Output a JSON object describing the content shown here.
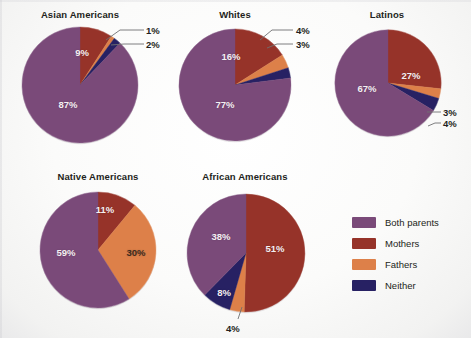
{
  "colors": {
    "both_parents": "#7a4a79",
    "mothers": "#963329",
    "fathers": "#dd8049",
    "neither": "#272163",
    "background": "#fbfbfa",
    "text": "#231f20",
    "label_light": "#f4eff2",
    "label_dark": "#3d2b1f",
    "leader_line": "#6f6f72"
  },
  "legend": {
    "position": "right",
    "items": [
      {
        "label": "Both parents",
        "color": "#7a4a79"
      },
      {
        "label": "Mothers",
        "color": "#963329"
      },
      {
        "label": "Fathers",
        "color": "#dd8049"
      },
      {
        "label": "Neither",
        "color": "#272163"
      }
    ]
  },
  "chart_data": {
    "type": "pie",
    "title": "",
    "subtitle": "",
    "xlabel": "",
    "ylabel": "",
    "grid": false,
    "legend_position": "right",
    "legend_entries": [
      "Both parents",
      "Mothers",
      "Fathers",
      "Neither"
    ],
    "units": "percent",
    "categories": [
      "Both parents",
      "Mothers",
      "Fathers",
      "Neither"
    ],
    "charts": [
      {
        "title": "Asian Americans",
        "values": [
          87,
          9,
          1,
          2
        ],
        "labels": [
          "87%",
          "9%",
          "1%",
          "2%"
        ],
        "label_placement": [
          "inside",
          "inside",
          "outside",
          "outside"
        ]
      },
      {
        "title": "Whites",
        "values": [
          77,
          16,
          4,
          3
        ],
        "labels": [
          "77%",
          "16%",
          "4%",
          "3%"
        ],
        "label_placement": [
          "inside",
          "inside",
          "outside",
          "outside"
        ]
      },
      {
        "title": "Latinos",
        "values": [
          67,
          27,
          3,
          4
        ],
        "labels": [
          "67%",
          "27%",
          "3%",
          "4%"
        ],
        "label_placement": [
          "inside",
          "inside",
          "outside",
          "outside"
        ]
      },
      {
        "title": "Native Americans",
        "values": [
          59,
          11,
          30,
          0
        ],
        "labels": [
          "59%",
          "11%",
          "30%",
          ""
        ],
        "label_placement": [
          "inside",
          "inside",
          "inside",
          "none"
        ]
      },
      {
        "title": "African Americans",
        "values": [
          38,
          51,
          4,
          8
        ],
        "labels": [
          "38%",
          "51%",
          "4%",
          "8%"
        ],
        "label_placement": [
          "inside",
          "inside",
          "outside",
          "inside"
        ]
      }
    ]
  },
  "pies": {
    "asian": {
      "title": "Asian Americans",
      "l_both": "87%",
      "l_mothers": "9%",
      "l_fathers": "1%",
      "l_neither": "2%"
    },
    "whites": {
      "title": "Whites",
      "l_both": "77%",
      "l_mothers": "16%",
      "l_fathers": "4%",
      "l_neither": "3%"
    },
    "latinos": {
      "title": "Latinos",
      "l_both": "67%",
      "l_mothers": "27%",
      "l_fathers": "3%",
      "l_neither": "4%"
    },
    "native": {
      "title": "Native Americans",
      "l_both": "59%",
      "l_mothers": "11%",
      "l_fathers": "30%"
    },
    "african": {
      "title": "African Americans",
      "l_both": "38%",
      "l_mothers": "51%",
      "l_fathers": "4%",
      "l_neither": "8%"
    }
  }
}
